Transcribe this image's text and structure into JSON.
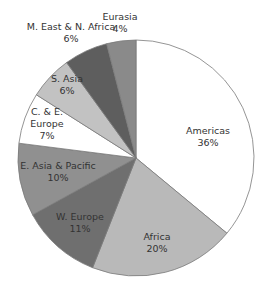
{
  "chart_data": {
    "type": "pie",
    "title": "",
    "start_angle_deg": 0,
    "direction": "clockwise",
    "center": [
      136,
      158
    ],
    "radius": 118,
    "slices": [
      {
        "label": "Americas",
        "value": 36,
        "value_label": "36%",
        "color": "#ffffff",
        "label_pos": [
          208,
          134
        ]
      },
      {
        "label": "Africa",
        "value": 20,
        "value_label": "20%",
        "color": "#b9b9b9",
        "label_pos": [
          157,
          240
        ]
      },
      {
        "label": "W. Europe",
        "value": 11,
        "value_label": "11%",
        "color": "#6f6f6f",
        "label_pos": [
          80,
          220
        ]
      },
      {
        "label": "E. Asia & Pacific",
        "value": 10,
        "value_label": "10%",
        "color": "#909090",
        "label_pos": [
          58,
          169
        ]
      },
      {
        "label": "C. & E. Europe",
        "value": 7,
        "value_label": "7%",
        "color": "#ffffff",
        "label_pos": [
          47,
          115
        ],
        "label_lines": [
          "C. & E.",
          "Europe",
          "7%"
        ]
      },
      {
        "label": "S. Asia",
        "value": 6,
        "value_label": "6%",
        "color": "#c2c2c2",
        "label_pos": [
          67,
          82
        ]
      },
      {
        "label": "M. East & N. Africa",
        "value": 6,
        "value_label": "6%",
        "color": "#5e5e5e",
        "label_pos": [
          71,
          30
        ]
      },
      {
        "label": "Eurasia",
        "value": 4,
        "value_label": "4%",
        "color": "#8a8a8a",
        "label_pos": [
          120,
          20
        ]
      }
    ],
    "edge_color": "#7a7a7a"
  }
}
